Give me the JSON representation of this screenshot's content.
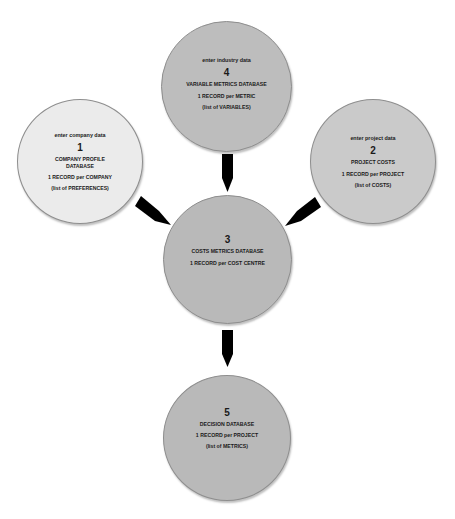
{
  "diagram": {
    "colors": {
      "background": "#ffffff",
      "arrow": "#000000",
      "border": "#8e8e8e",
      "text": "#1a1a1a"
    },
    "nodes": [
      {
        "id": "1",
        "intro": "enter company data",
        "number": "1",
        "title": "COMPANY PROFILE\nDATABASE",
        "record": "1 RECORD per COMPANY",
        "list": "(list of PREFERENCES)",
        "fill": "#ebebeb"
      },
      {
        "id": "2",
        "intro": "enter project data",
        "number": "2",
        "title": "PROJECT COSTS",
        "record": "1 RECORD per PROJECT",
        "list": "(list of COSTS)",
        "fill": "#cacaca"
      },
      {
        "id": "3",
        "intro": "",
        "number": "3",
        "title": "COSTS METRICS DATABASE",
        "record": "1 RECORD per COST CENTRE",
        "list": "",
        "fill": "#b9b9b9"
      },
      {
        "id": "4",
        "intro": "enter industry data",
        "number": "4",
        "title": "VARIABLE METRICS DATABASE",
        "record": "1 RECORD per METRIC",
        "list": "(list of VARIABLES)",
        "fill": "#bdbdbd"
      },
      {
        "id": "5",
        "intro": "",
        "number": "5",
        "title": "DECISION DATABASE",
        "record": "1 RECORD per PROJECT",
        "list": "(list of METRICS)",
        "fill": "#b9b9b9"
      }
    ],
    "edges": [
      {
        "from": "4",
        "to": "3"
      },
      {
        "from": "1",
        "to": "3"
      },
      {
        "from": "2",
        "to": "3"
      },
      {
        "from": "3",
        "to": "5"
      }
    ]
  }
}
